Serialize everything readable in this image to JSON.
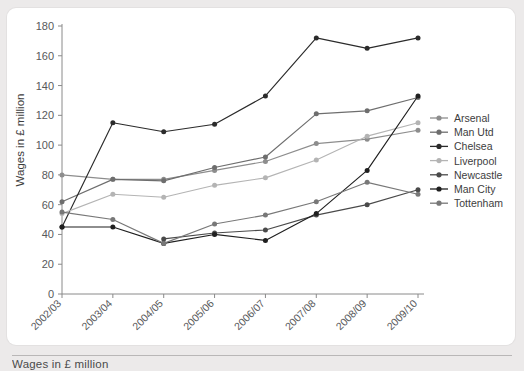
{
  "caption": "Wages in £ million",
  "chart_data": {
    "type": "line",
    "title": "",
    "xlabel": "",
    "ylabel": "Wages in £ million",
    "categories": [
      "2002/03",
      "2003/04",
      "2004/05",
      "2005/06",
      "2006/07",
      "2007/08",
      "2008/09",
      "2009/10"
    ],
    "ylim": [
      0,
      180
    ],
    "yticks": [
      0,
      20,
      40,
      60,
      80,
      100,
      120,
      140,
      160,
      180
    ],
    "grid": false,
    "legend_position": "right",
    "series": [
      {
        "name": "Arsenal",
        "color": "#8d8d8d",
        "values": [
          80,
          77,
          77,
          83,
          89,
          101,
          104,
          110
        ]
      },
      {
        "name": "Man Utd",
        "color": "#6e6e6e",
        "values": [
          62,
          77,
          76,
          85,
          92,
          121,
          123,
          132
        ]
      },
      {
        "name": "Chelsea",
        "color": "#2b2b2b",
        "values": [
          45,
          115,
          109,
          114,
          133,
          172,
          165,
          172
        ]
      },
      {
        "name": "Liverpool",
        "color": "#b4b4b4",
        "values": [
          54,
          67,
          65,
          73,
          78,
          90,
          106,
          115
        ]
      },
      {
        "name": "Newcastle",
        "color": "#4a4a4a",
        "values": [
          null,
          null,
          37,
          41,
          43,
          53,
          60,
          70
        ]
      },
      {
        "name": "Man City",
        "color": "#1f1f1f",
        "values": [
          45,
          45,
          34,
          40,
          36,
          54,
          83,
          133
        ]
      },
      {
        "name": "Tottenham",
        "color": "#787878",
        "values": [
          55,
          50,
          34,
          47,
          53,
          62,
          75,
          67
        ]
      }
    ]
  },
  "axis": {
    "ytick_labels": [
      "0",
      "20",
      "40",
      "60",
      "80",
      "100",
      "120",
      "140",
      "160",
      "180"
    ]
  }
}
